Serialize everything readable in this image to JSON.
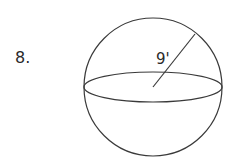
{
  "problem": {
    "number": "8."
  },
  "figure": {
    "shape": "sphere",
    "radius_label": "9'",
    "center": [
      153,
      87
    ],
    "radius_px": 69,
    "equator_ry": 15,
    "stroke_color": "#3a3a3a"
  }
}
